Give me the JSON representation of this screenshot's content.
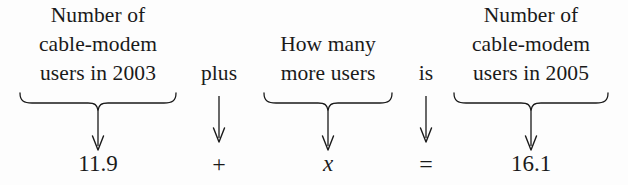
{
  "diagram": {
    "background_color": "#fdfdfd",
    "ink_color": "#1a1a1a",
    "equation": "11.9 + x = 16.1",
    "columns": [
      {
        "id": "cable-modem-users-2003",
        "kind": "phrase",
        "has_brace": true,
        "lines": [
          "Number of",
          "cable-modem",
          "users in 2003"
        ],
        "arrow": "down-arrow",
        "value": "11.9",
        "value_style": "number"
      },
      {
        "id": "plus",
        "kind": "operator-word",
        "has_brace": false,
        "lines": [
          "plus"
        ],
        "arrow": "down-arrow",
        "value": "+",
        "value_style": "operator"
      },
      {
        "id": "how-many-more-users",
        "kind": "phrase",
        "has_brace": true,
        "lines": [
          "How many",
          "more users"
        ],
        "arrow": "down-arrow",
        "value": "x",
        "value_style": "variable"
      },
      {
        "id": "is",
        "kind": "operator-word",
        "has_brace": false,
        "lines": [
          "is"
        ],
        "arrow": "down-arrow",
        "value": "=",
        "value_style": "operator"
      },
      {
        "id": "cable-modem-users-2005",
        "kind": "phrase",
        "has_brace": true,
        "lines": [
          "Number of",
          "cable-modem",
          "users in 2005"
        ],
        "arrow": "down-arrow",
        "value": "16.1",
        "value_style": "number"
      }
    ]
  }
}
